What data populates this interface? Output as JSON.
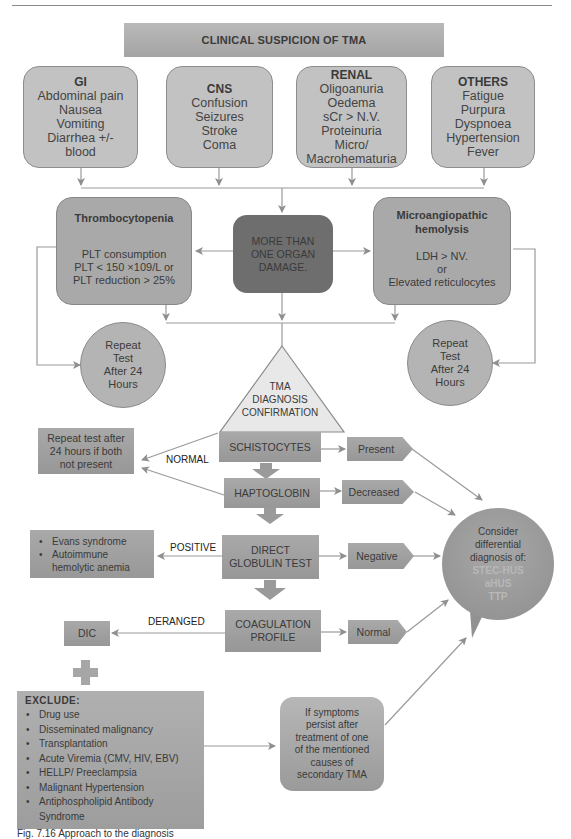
{
  "header": {
    "title": "CLINICAL SUSPICION OF TMA"
  },
  "symptom_groups": [
    {
      "title": "GI",
      "items": [
        "Abdominal pain",
        "Nausea",
        "Vomiting",
        "Diarrhea +/-",
        "blood"
      ]
    },
    {
      "title": "CNS",
      "items": [
        "Confusion",
        "Seizures",
        "Stroke",
        "Coma"
      ]
    },
    {
      "title": "RENAL",
      "items": [
        "Oligoanuria",
        "Oedema",
        "sCr > N.V.",
        "Proteinuria",
        "Micro/",
        "Macrohematuria"
      ]
    },
    {
      "title": "OTHERS",
      "items": [
        "Fatigue",
        "Purpura",
        "Dyspnoea",
        "Hypertension",
        "Fever"
      ]
    }
  ],
  "center_node": {
    "lines": [
      "MORE THAN",
      "ONE ORGAN",
      "DAMAGE."
    ]
  },
  "thrombocytopenia": {
    "title": "Thrombocytopenia",
    "lines": [
      "PLT consumption",
      "PLT < 150 ×109/L or",
      "PLT reduction > 25%"
    ]
  },
  "hemolysis": {
    "title_lines": [
      "Microangiopathic",
      "hemolysis"
    ],
    "lines": [
      "LDH > NV.",
      "or",
      "Elevated reticulocytes"
    ]
  },
  "repeat_left": {
    "lines": [
      "Repeat",
      "Test",
      "After 24",
      "Hours"
    ]
  },
  "repeat_right": {
    "lines": [
      "Repeat",
      "Test",
      "After 24",
      "Hours"
    ]
  },
  "confirmation": {
    "lines": [
      "TMA",
      "DIAGNOSIS",
      "CONFIRMATION"
    ]
  },
  "repeat_if_absent": {
    "lines": [
      "Repeat test after",
      "24 hours if both",
      "not present"
    ]
  },
  "edge_labels": {
    "normal": "NORMAL",
    "positive": "POSITIVE",
    "deranged": "DERANGED"
  },
  "tests": [
    {
      "name": "SCHISTOCYTES",
      "result": "Present"
    },
    {
      "name": "HAPTOGLOBIN",
      "result": "Decreased"
    },
    {
      "name_lines": [
        "DIRECT",
        "GLOBULIN TEST"
      ],
      "result": "Negative"
    },
    {
      "name_lines": [
        "COAGULATION",
        "PROFILE"
      ],
      "result": "Normal"
    }
  ],
  "positive_outcomes": [
    "Evans syndrome",
    "Autoimmune",
    "hemolytic anemia"
  ],
  "dic": {
    "label": "DIC"
  },
  "differential": {
    "lines": [
      "Consider",
      "differential",
      "diagnosis of:"
    ],
    "diagnoses": [
      "STEC-HUS",
      "aHUS",
      "TTP"
    ]
  },
  "exclude": {
    "title": "EXCLUDE:",
    "items": [
      "Drug use",
      "Disseminated malignancy",
      "Transplantation",
      "Acute Viremia (CMV, HIV, EBV)",
      "HELLP/ Preeclampsia",
      "Malignant Hypertension",
      "Antiphospholipid Antibody Syndrome"
    ]
  },
  "persist": {
    "lines": [
      "If symptoms",
      "persist after",
      "treatment of one",
      "of the mentioned",
      "causes of",
      "secondary TMA"
    ]
  },
  "caption": "Fig. 7.16  Approach to the diagnosis"
}
